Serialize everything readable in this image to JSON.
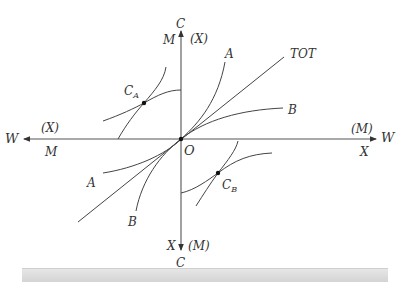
{
  "diagram": {
    "origin_label": "O",
    "axes": {
      "left": {
        "end": "W",
        "above": "(X)",
        "below": "M"
      },
      "right": {
        "end": "W",
        "above": "(M)",
        "below": "X"
      },
      "top": {
        "end": "C",
        "left": "M",
        "right": "(X)"
      },
      "bottom": {
        "end": "C",
        "left": "X",
        "right": "(M)"
      }
    },
    "curves": {
      "tot": "TOT",
      "a_upper": "A",
      "a_lower": "A",
      "b_upper": "B",
      "b_lower": "B"
    },
    "points": {
      "ca": {
        "main": "C",
        "sub": "A"
      },
      "cb": {
        "main": "C",
        "sub": "B"
      }
    },
    "colors": {
      "line": "#444444",
      "text": "#333333",
      "bar": "#d9d9d9"
    }
  }
}
